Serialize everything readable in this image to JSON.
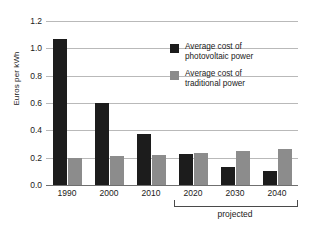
{
  "chart_data": {
    "type": "bar",
    "title": "",
    "xlabel": "",
    "ylabel": "Euros per kWh",
    "categories": [
      "1990",
      "2000",
      "2010",
      "2020",
      "2030",
      "2040"
    ],
    "series": [
      {
        "name": "Average cost of photovoltaic power",
        "color": "#1c1c1c",
        "values": [
          1.07,
          0.6,
          0.37,
          0.225,
          0.13,
          0.1
        ]
      },
      {
        "name": "Average cost of traditional power",
        "color": "#8c8c8c",
        "values": [
          0.2,
          0.21,
          0.22,
          0.235,
          0.25,
          0.26
        ]
      }
    ],
    "ylim": [
      0.0,
      1.2
    ],
    "ytick_labels": [
      "0.0",
      "0.2",
      "0.4",
      "0.6",
      "0.8",
      "1.0",
      "1.2"
    ],
    "ytick_values": [
      0.0,
      0.2,
      0.4,
      0.6,
      0.8,
      1.0,
      1.2
    ],
    "grid": true,
    "legend_position": "upper-right",
    "annotations": [
      {
        "name": "projected-bracket",
        "label": "projected",
        "covers": [
          "2020",
          "2030",
          "2040"
        ]
      }
    ]
  },
  "legend": {
    "entries": [
      {
        "line1": "Average cost of",
        "line2": "photovoltaic power",
        "swatch": "pv"
      },
      {
        "line1": "Average cost of",
        "line2": "traditional power",
        "swatch": "trad"
      }
    ]
  },
  "axis": {
    "y_title": "Euros per kWh",
    "ticks": [
      "0.0",
      "0.2",
      "0.4",
      "0.6",
      "0.8",
      "1.0",
      "1.2"
    ],
    "categories": [
      "1990",
      "2000",
      "2010",
      "2020",
      "2030",
      "2040"
    ]
  },
  "annotation": {
    "projected_label": "projected"
  }
}
